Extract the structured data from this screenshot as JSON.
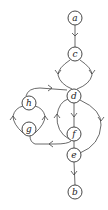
{
  "diagram": {
    "type": "directed-graph",
    "nodes": [
      {
        "id": "a",
        "label": "a",
        "x": 75,
        "y": 18
      },
      {
        "id": "c",
        "label": "c",
        "x": 75,
        "y": 54
      },
      {
        "id": "d",
        "label": "d",
        "x": 74,
        "y": 96
      },
      {
        "id": "h",
        "label": "h",
        "x": 29,
        "y": 103
      },
      {
        "id": "g",
        "label": "g",
        "x": 29,
        "y": 129
      },
      {
        "id": "f",
        "label": "f",
        "x": 74,
        "y": 134
      },
      {
        "id": "e",
        "label": "e",
        "x": 74,
        "y": 155
      },
      {
        "id": "b",
        "label": "b",
        "x": 75,
        "y": 192
      }
    ],
    "edges": [
      {
        "from": "a",
        "to": "c"
      },
      {
        "from": "c",
        "to": "d",
        "route": "left"
      },
      {
        "from": "c",
        "to": "d",
        "route": "right"
      },
      {
        "from": "h",
        "to": "d"
      },
      {
        "from": "d",
        "to": "f"
      },
      {
        "from": "f",
        "to": "d",
        "route": "left-arc"
      },
      {
        "from": "d",
        "to": "e",
        "route": "right-arc"
      },
      {
        "from": "f",
        "to": "e"
      },
      {
        "from": "f",
        "to": "g"
      },
      {
        "from": "g",
        "to": "h",
        "route": "left-arc"
      },
      {
        "from": "g",
        "to": "h",
        "route": "right-arc"
      },
      {
        "from": "e",
        "to": "b"
      }
    ]
  }
}
